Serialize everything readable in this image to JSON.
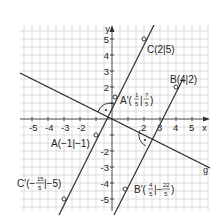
{
  "axes": {
    "x_label": "x",
    "y_label": "y",
    "x_ticks": [
      "-5",
      "-4",
      "-3",
      "-2",
      "2",
      "3",
      "4",
      "5"
    ],
    "y_ticks": [
      "5",
      "4",
      "3",
      "2",
      "-2",
      "-3",
      "-4",
      "-5"
    ]
  },
  "line_label": "g",
  "points": {
    "C": {
      "label": "C(2|5)",
      "x": 2,
      "y": 5
    },
    "B": {
      "label": "B(4|2)",
      "x": 4,
      "y": 2
    },
    "A": {
      "label": "A(−1|−1)",
      "x": -1,
      "y": -1
    },
    "A_prime": {
      "prefix": "A'(",
      "num1": "1",
      "den1": "5",
      "sep": "|",
      "num2": "7",
      "den2": "5",
      "suffix": ")",
      "x": 0.2,
      "y": 1.4
    },
    "B_prime": {
      "prefix": "B'(",
      "num1": "4",
      "den1": "5",
      "sep": "|−",
      "num2": "22",
      "den2": "5",
      "suffix": ")",
      "x": 0.8,
      "y": -4.4
    },
    "C_prime": {
      "prefix": "C'(−",
      "num1": "15",
      "den1": "5",
      "sep": "|−5)",
      "x": -3,
      "y": -5
    }
  }
}
